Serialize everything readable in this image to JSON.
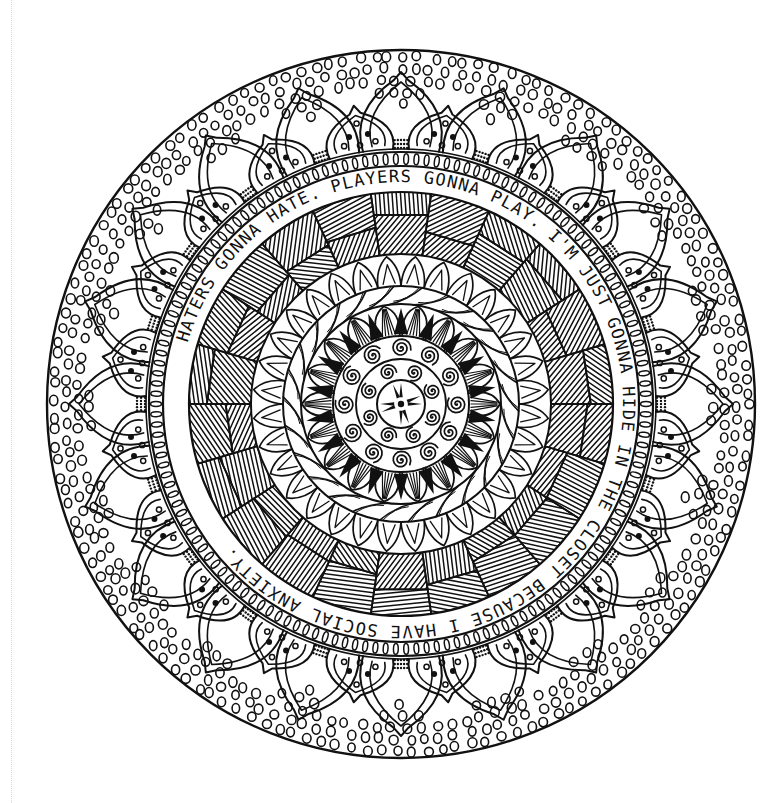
{
  "canvas": {
    "width": 780,
    "height": 803,
    "background": "#ffffff",
    "ink": "#111111"
  },
  "mandala": {
    "center": {
      "x": 401,
      "y": 404
    },
    "outer_radius": 354,
    "ring_text": "HATERS GONNA HATE.  PLAYERS GONNA PLAY.  I'M JUST GONNA HIDE IN THE CLOSET BECAUSE I HAVE SOCIAL ANXIETY.",
    "ring_text_radius": 222,
    "ring_text_start_angle_deg": 196,
    "bands": [
      {
        "name": "outer-dotted-circles-band",
        "inner": 252,
        "outer": 354,
        "pattern": "small-circles"
      },
      {
        "name": "petal-layer-outer",
        "count": 20,
        "base_radius": 255,
        "tip_radius": 332,
        "pattern": "teardrop-petals"
      },
      {
        "name": "petal-layer-inner",
        "count": 20,
        "base_radius": 255,
        "tip_radius": 302,
        "pattern": "teardrop-petals-with-dots"
      },
      {
        "name": "knotted-ring",
        "inner": 238,
        "outer": 252,
        "pattern": "oval-links"
      },
      {
        "name": "text-band",
        "inner": 212,
        "outer": 238,
        "pattern": "lettering"
      },
      {
        "name": "hatched-band",
        "inner": 150,
        "outer": 212,
        "pattern": "crosshatch-patches"
      },
      {
        "name": "scallop-ring",
        "inner": 118,
        "outer": 150,
        "count": 32,
        "pattern": "pointed-scallops"
      },
      {
        "name": "rope-ring",
        "inner": 100,
        "outer": 118,
        "pattern": "twisted-rope"
      },
      {
        "name": "dark-leaf-ring",
        "inner": 68,
        "outer": 100,
        "count": 18,
        "pattern": "veined-leaves"
      },
      {
        "name": "spiral-ring-outer",
        "inner": 45,
        "outer": 68,
        "count": 12,
        "pattern": "spirals"
      },
      {
        "name": "spiral-ring-inner",
        "inner": 24,
        "outer": 45,
        "count": 8,
        "pattern": "spirals"
      },
      {
        "name": "center-medallion",
        "inner": 0,
        "outer": 24,
        "pattern": "eight-point-star"
      }
    ]
  }
}
